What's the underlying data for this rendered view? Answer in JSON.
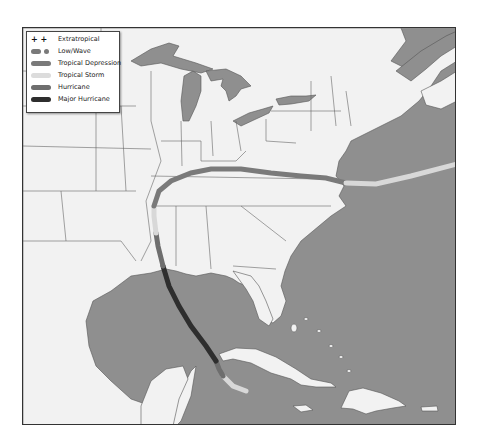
{
  "legend": {
    "items": [
      {
        "label": "Extratropical",
        "symbol": "+ +",
        "color": "#111111"
      },
      {
        "label": "Low/Wave",
        "symbol": "dots",
        "color": "#7a7a7a"
      },
      {
        "label": "Tropical Depression",
        "symbol": "bar",
        "color": "#7a7a7a"
      },
      {
        "label": "Tropical Storm",
        "symbol": "bar",
        "color": "#dcdcdc"
      },
      {
        "label": "Hurricane",
        "symbol": "bar",
        "color": "#6e6e6e"
      },
      {
        "label": "Major Hurricane",
        "symbol": "bar",
        "color": "#2e2e2e"
      }
    ]
  },
  "colors": {
    "ocean": "#8f8f8f",
    "land": "#f2f2f2",
    "border": "#555555"
  },
  "track": {
    "segments": [
      {
        "category": "Tropical Storm",
        "color": "#d8d8d8"
      },
      {
        "category": "Hurricane",
        "color": "#6e6e6e"
      },
      {
        "category": "Major Hurricane",
        "color": "#2e2e2e"
      },
      {
        "category": "Hurricane",
        "color": "#6e6e6e"
      },
      {
        "category": "Tropical Storm",
        "color": "#d8d8d8"
      },
      {
        "category": "Tropical Depression",
        "color": "#7a7a7a"
      },
      {
        "category": "Tropical Storm",
        "color": "#d8d8d8"
      }
    ]
  }
}
